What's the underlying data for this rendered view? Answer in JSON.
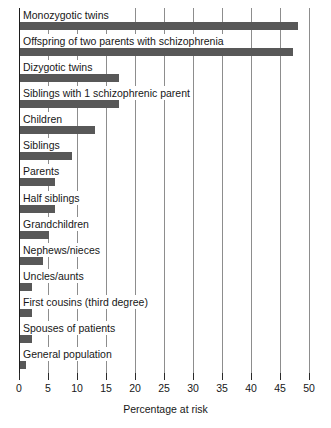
{
  "chart_data": {
    "type": "bar",
    "orientation": "horizontal",
    "title": "",
    "xlabel": "Percentage at risk",
    "ylabel": "",
    "xlim": [
      0,
      50
    ],
    "xticks": [
      0,
      5,
      10,
      15,
      20,
      25,
      30,
      35,
      40,
      45,
      50
    ],
    "grid": true,
    "legend": false,
    "bar_color": "#585858",
    "categories": [
      "Monozygotic twins",
      "Offspring of two parents with schizophrenia",
      "Dizygotic twins",
      "Siblings with 1 schizophrenic parent",
      "Children",
      "Siblings",
      "Parents",
      "Half siblings",
      "Grandchildren",
      "Nephews/nieces",
      "Uncles/aunts",
      "First cousins (third degree)",
      "Spouses of patients",
      "General population"
    ],
    "values": [
      48,
      47,
      17,
      17,
      13,
      9,
      6,
      6,
      5,
      4,
      2,
      2,
      2,
      1
    ]
  },
  "axis": {
    "x_title": "Percentage at risk",
    "tick_labels": [
      "0",
      "5",
      "10",
      "15",
      "20",
      "25",
      "30",
      "35",
      "40",
      "45",
      "50"
    ]
  }
}
